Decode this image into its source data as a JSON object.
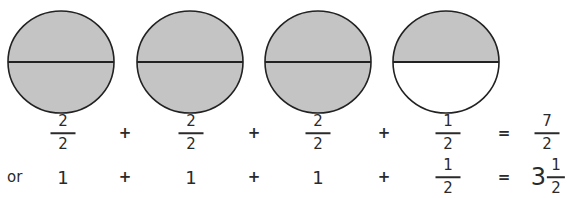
{
  "colors": {
    "shaded": "#c4c4c4",
    "unshaded": "#ffffff",
    "stroke": "#222222",
    "text": "#2a2a2a"
  },
  "circles": [
    {
      "cx": 61,
      "cy": 62,
      "rx": 53,
      "ry": 51,
      "parts": 2,
      "shaded_parts": 2,
      "top_shaded": true,
      "bottom_shaded": true
    },
    {
      "cx": 190,
      "cy": 62,
      "rx": 53,
      "ry": 51,
      "parts": 2,
      "shaded_parts": 2,
      "top_shaded": true,
      "bottom_shaded": true
    },
    {
      "cx": 318,
      "cy": 62,
      "rx": 53,
      "ry": 51,
      "parts": 2,
      "shaded_parts": 2,
      "top_shaded": true,
      "bottom_shaded": true
    },
    {
      "cx": 446,
      "cy": 62,
      "rx": 53,
      "ry": 51,
      "parts": 2,
      "shaded_parts": 1,
      "top_shaded": true,
      "bottom_shaded": false
    }
  ],
  "row1": {
    "terms": [
      {
        "numerator": "2",
        "denominator": "2"
      },
      {
        "numerator": "2",
        "denominator": "2"
      },
      {
        "numerator": "2",
        "denominator": "2"
      },
      {
        "numerator": "1",
        "denominator": "2"
      }
    ],
    "operators": [
      "+",
      "+",
      "+"
    ],
    "equals": "=",
    "result": {
      "numerator": "7",
      "denominator": "2"
    }
  },
  "row2": {
    "prefix": "or",
    "terms": [
      "1",
      "1",
      "1"
    ],
    "last_term": {
      "numerator": "1",
      "denominator": "2"
    },
    "operators": [
      "+",
      "+",
      "+"
    ],
    "equals": "=",
    "result": {
      "whole": "3",
      "numerator": "1",
      "denominator": "2"
    }
  }
}
